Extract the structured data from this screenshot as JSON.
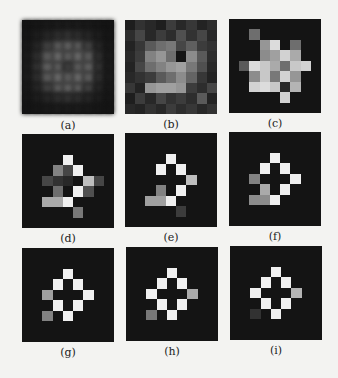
{
  "figure": {
    "panels": [
      {
        "id": "a",
        "label": "(a)"
      },
      {
        "id": "b",
        "label": "(b)"
      },
      {
        "id": "c",
        "label": "(c)"
      },
      {
        "id": "d",
        "label": "(d)"
      },
      {
        "id": "e",
        "label": "(e)"
      },
      {
        "id": "f",
        "label": "(f)"
      },
      {
        "id": "g",
        "label": "(g)"
      },
      {
        "id": "h",
        "label": "(h)"
      },
      {
        "id": "i",
        "label": "(i)"
      }
    ]
  },
  "chart_data": {
    "type": "heatmap",
    "title": "",
    "layout": "3x3 grid of 9x9 grayscale images",
    "grid_size": [
      9,
      9
    ],
    "value_range": [
      0,
      255
    ],
    "panels": [
      {
        "label": "(a)",
        "values": [
          [
            20,
            22,
            24,
            26,
            26,
            26,
            24,
            22,
            20
          ],
          [
            22,
            28,
            36,
            44,
            48,
            44,
            36,
            28,
            22
          ],
          [
            24,
            36,
            62,
            86,
            92,
            86,
            62,
            36,
            24
          ],
          [
            26,
            44,
            86,
            100,
            88,
            100,
            86,
            44,
            26
          ],
          [
            26,
            48,
            92,
            88,
            60,
            88,
            92,
            48,
            26
          ],
          [
            26,
            44,
            86,
            100,
            88,
            100,
            86,
            44,
            26
          ],
          [
            24,
            36,
            62,
            86,
            92,
            86,
            62,
            36,
            24
          ],
          [
            22,
            28,
            36,
            44,
            48,
            44,
            36,
            28,
            22
          ],
          [
            20,
            22,
            24,
            26,
            26,
            26,
            24,
            22,
            20
          ]
        ]
      },
      {
        "label": "(b)",
        "values": [
          [
            30,
            50,
            40,
            30,
            60,
            40,
            55,
            35,
            45
          ],
          [
            45,
            70,
            40,
            60,
            45,
            80,
            50,
            70,
            40
          ],
          [
            35,
            55,
            90,
            110,
            120,
            70,
            95,
            60,
            50
          ],
          [
            40,
            60,
            130,
            150,
            110,
            20,
            140,
            90,
            45
          ],
          [
            35,
            70,
            110,
            130,
            150,
            160,
            120,
            80,
            40
          ],
          [
            40,
            50,
            60,
            90,
            110,
            140,
            100,
            55,
            35
          ],
          [
            55,
            35,
            150,
            160,
            160,
            150,
            60,
            45,
            70
          ],
          [
            30,
            60,
            40,
            70,
            50,
            60,
            45,
            90,
            35
          ],
          [
            40,
            35,
            50,
            40,
            60,
            45,
            55,
            40,
            50
          ]
        ]
      },
      {
        "label": "(c)",
        "values": [
          [
            20,
            20,
            20,
            20,
            20,
            20,
            20,
            20,
            20
          ],
          [
            20,
            20,
            110,
            20,
            20,
            20,
            20,
            20,
            20
          ],
          [
            20,
            20,
            20,
            150,
            220,
            20,
            110,
            20,
            20
          ],
          [
            20,
            20,
            20,
            140,
            160,
            210,
            170,
            20,
            20
          ],
          [
            20,
            90,
            220,
            200,
            170,
            110,
            200,
            210,
            20
          ],
          [
            20,
            20,
            140,
            200,
            120,
            210,
            150,
            20,
            20
          ],
          [
            20,
            20,
            210,
            220,
            200,
            40,
            180,
            20,
            20
          ],
          [
            20,
            20,
            20,
            20,
            20,
            210,
            20,
            20,
            20
          ],
          [
            20,
            20,
            20,
            20,
            20,
            20,
            20,
            20,
            20
          ]
        ]
      },
      {
        "label": "(d)",
        "values": [
          [
            20,
            20,
            20,
            20,
            20,
            20,
            20,
            20,
            20
          ],
          [
            20,
            20,
            20,
            20,
            20,
            20,
            20,
            20,
            20
          ],
          [
            20,
            20,
            20,
            20,
            240,
            20,
            20,
            20,
            20
          ],
          [
            20,
            20,
            20,
            130,
            70,
            240,
            20,
            20,
            20
          ],
          [
            20,
            20,
            70,
            50,
            40,
            20,
            190,
            70,
            20
          ],
          [
            20,
            20,
            20,
            110,
            20,
            240,
            80,
            20,
            20
          ],
          [
            20,
            20,
            170,
            170,
            240,
            20,
            20,
            20,
            20
          ],
          [
            20,
            20,
            20,
            20,
            20,
            120,
            20,
            20,
            20
          ],
          [
            20,
            20,
            20,
            20,
            20,
            20,
            20,
            20,
            20
          ]
        ]
      },
      {
        "label": "(e)",
        "values": [
          [
            20,
            20,
            20,
            20,
            20,
            20,
            20,
            20,
            20
          ],
          [
            20,
            20,
            20,
            20,
            20,
            20,
            20,
            20,
            20
          ],
          [
            20,
            20,
            20,
            20,
            240,
            20,
            20,
            20,
            20
          ],
          [
            20,
            20,
            20,
            240,
            20,
            240,
            20,
            20,
            20
          ],
          [
            20,
            20,
            20,
            20,
            20,
            20,
            190,
            20,
            20
          ],
          [
            20,
            20,
            20,
            130,
            20,
            240,
            20,
            20,
            20
          ],
          [
            20,
            20,
            160,
            160,
            240,
            20,
            20,
            20,
            20
          ],
          [
            20,
            20,
            20,
            20,
            20,
            60,
            20,
            20,
            20
          ],
          [
            20,
            20,
            20,
            20,
            20,
            20,
            20,
            20,
            20
          ]
        ]
      },
      {
        "label": "(f)",
        "values": [
          [
            20,
            20,
            20,
            20,
            20,
            20,
            20,
            20,
            20
          ],
          [
            20,
            20,
            20,
            20,
            20,
            20,
            20,
            20,
            20
          ],
          [
            20,
            20,
            20,
            20,
            240,
            20,
            20,
            20,
            20
          ],
          [
            20,
            20,
            20,
            240,
            20,
            240,
            20,
            20,
            20
          ],
          [
            20,
            20,
            130,
            20,
            20,
            20,
            240,
            20,
            20
          ],
          [
            20,
            20,
            20,
            170,
            20,
            240,
            20,
            20,
            20
          ],
          [
            20,
            20,
            140,
            140,
            240,
            20,
            20,
            20,
            20
          ],
          [
            20,
            20,
            20,
            20,
            20,
            20,
            20,
            20,
            20
          ],
          [
            20,
            20,
            20,
            20,
            20,
            20,
            20,
            20,
            20
          ]
        ]
      },
      {
        "label": "(g)",
        "values": [
          [
            20,
            20,
            20,
            20,
            20,
            20,
            20,
            20,
            20
          ],
          [
            20,
            20,
            20,
            20,
            20,
            20,
            20,
            20,
            20
          ],
          [
            20,
            20,
            20,
            20,
            240,
            20,
            20,
            20,
            20
          ],
          [
            20,
            20,
            20,
            240,
            20,
            240,
            20,
            20,
            20
          ],
          [
            20,
            20,
            160,
            20,
            20,
            20,
            240,
            20,
            20
          ],
          [
            20,
            20,
            20,
            240,
            20,
            240,
            20,
            20,
            20
          ],
          [
            20,
            20,
            130,
            20,
            240,
            20,
            20,
            20,
            20
          ],
          [
            20,
            20,
            20,
            20,
            20,
            20,
            20,
            20,
            20
          ],
          [
            20,
            20,
            20,
            20,
            20,
            20,
            20,
            20,
            20
          ]
        ]
      },
      {
        "label": "(h)",
        "values": [
          [
            20,
            20,
            20,
            20,
            20,
            20,
            20,
            20,
            20
          ],
          [
            20,
            20,
            20,
            20,
            20,
            20,
            20,
            20,
            20
          ],
          [
            20,
            20,
            20,
            20,
            240,
            20,
            20,
            20,
            20
          ],
          [
            20,
            20,
            20,
            240,
            20,
            240,
            20,
            20,
            20
          ],
          [
            20,
            20,
            240,
            20,
            20,
            20,
            170,
            20,
            20
          ],
          [
            20,
            20,
            20,
            240,
            20,
            240,
            20,
            20,
            20
          ],
          [
            20,
            20,
            120,
            20,
            240,
            20,
            20,
            20,
            20
          ],
          [
            20,
            20,
            20,
            20,
            20,
            20,
            20,
            20,
            20
          ],
          [
            20,
            20,
            20,
            20,
            20,
            20,
            20,
            20,
            20
          ]
        ]
      },
      {
        "label": "(i)",
        "values": [
          [
            20,
            20,
            20,
            20,
            20,
            20,
            20,
            20,
            20
          ],
          [
            20,
            20,
            20,
            20,
            20,
            20,
            20,
            20,
            20
          ],
          [
            20,
            20,
            20,
            20,
            240,
            20,
            20,
            20,
            20
          ],
          [
            20,
            20,
            20,
            240,
            20,
            240,
            20,
            20,
            20
          ],
          [
            20,
            20,
            240,
            20,
            20,
            20,
            180,
            20,
            20
          ],
          [
            20,
            20,
            20,
            240,
            20,
            240,
            20,
            20,
            20
          ],
          [
            20,
            20,
            50,
            20,
            240,
            20,
            20,
            20,
            20
          ],
          [
            20,
            20,
            20,
            20,
            20,
            20,
            20,
            20,
            20
          ],
          [
            20,
            20,
            20,
            20,
            20,
            20,
            20,
            20,
            20
          ]
        ]
      }
    ]
  }
}
